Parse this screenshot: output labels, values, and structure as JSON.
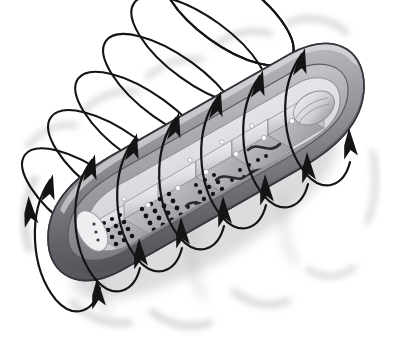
{
  "figure": {
    "subject": "mitochondrion",
    "style": "grayscale airbrush scientific illustration",
    "background_color": "#ffffff",
    "width": 394,
    "height": 346,
    "alt_text": "Cutaway three-quarter view of a mitochondrion drawn in grey tones, with seven elliptical arrow loops wrapping around its long axis, each arrow pointing downward."
  },
  "palette": {
    "outer_membrane_light": "#c9c9cd",
    "outer_membrane_mid": "#9a9aa0",
    "outer_membrane_dark": "#6e6e74",
    "outer_membrane_shadow": "#4e4e54",
    "inner_matrix_light": "#e8e8ea",
    "inner_matrix_mid": "#cfcfd3",
    "crista_face": "#dcdce0",
    "crista_edge": "#a6a6ac",
    "granule": "#1a1a1a",
    "outline": "#3a3a3a",
    "arrow_stroke": "#141414",
    "blur_smudge": "#b5b5ba"
  },
  "organelle": {
    "name": "mitochondrion",
    "parts": [
      {
        "id": "outer-membrane",
        "label": "Outer membrane",
        "tone": "#8e8e94"
      },
      {
        "id": "inner-membrane",
        "label": "Inner membrane",
        "tone": "#b8b8be"
      },
      {
        "id": "intermembrane-space",
        "label": "Intermembrane space",
        "tone": "#dadade"
      },
      {
        "id": "matrix",
        "label": "Matrix",
        "tone": "#ececee"
      },
      {
        "id": "cristae",
        "label": "Cristae",
        "tone": "#d6d6da",
        "count": 7
      },
      {
        "id": "matrix-granules",
        "label": "Matrix granules",
        "tone": "#141414",
        "count": 96
      },
      {
        "id": "mitochondrial-dna",
        "label": "Mitochondrial DNA strand",
        "tone": "#2b2b2b",
        "count": 3
      }
    ],
    "body_axis": {
      "left_cap_cx": 86,
      "left_cap_cy": 232,
      "right_cap_cx": 312,
      "right_cap_cy": 104,
      "half_width": 58
    }
  },
  "field_lines": {
    "label": "Circular field lines",
    "description": "Elliptical loops wrapping the long axis of the organelle, each bearing a single arrowhead indicating direction of circulation.",
    "stroke_color": "#141414",
    "stroke_width": 2.1,
    "arrow_count": 11,
    "loops": [
      {
        "id": "loop-1",
        "cx": 63,
        "cy": 238,
        "rx": 31,
        "ry": 78,
        "rot": -27,
        "arrow_t": 0.3,
        "smudge": true
      },
      {
        "id": "loop-2",
        "cx": 103,
        "cy": 218,
        "rx": 32,
        "ry": 80,
        "rot": -27,
        "arrow_t": 0.3,
        "smudge": true
      },
      {
        "id": "loop-3",
        "cx": 144,
        "cy": 197,
        "rx": 33,
        "ry": 81,
        "rot": -27,
        "arrow_t": 0.3,
        "smudge": true
      },
      {
        "id": "loop-4",
        "cx": 186,
        "cy": 176,
        "rx": 33,
        "ry": 82,
        "rot": -27,
        "arrow_t": 0.3,
        "smudge": true
      },
      {
        "id": "loop-5",
        "cx": 228,
        "cy": 155,
        "rx": 33,
        "ry": 82,
        "rot": -27,
        "arrow_t": 0.3,
        "smudge": true
      },
      {
        "id": "loop-6",
        "cx": 270,
        "cy": 133,
        "rx": 33,
        "ry": 81,
        "rot": -27,
        "arrow_t": 0.3,
        "smudge": true
      },
      {
        "id": "loop-7",
        "cx": 312,
        "cy": 112,
        "rx": 32,
        "ry": 78,
        "rot": -27,
        "arrow_t": 0.3,
        "smudge": true
      }
    ]
  },
  "chart_data": {
    "type": "diagram",
    "elements": [
      {
        "name": "mitochondrion body",
        "count": 1
      },
      {
        "name": "cristae shelves",
        "count": 7
      },
      {
        "name": "field-line loops",
        "count": 7
      },
      {
        "name": "arrowheads",
        "count": 11
      },
      {
        "name": "matrix granule clusters",
        "count": 4
      }
    ],
    "legend": [],
    "annotations": []
  }
}
